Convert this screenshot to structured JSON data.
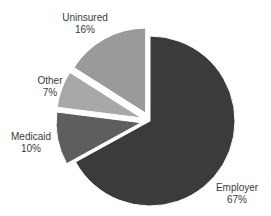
{
  "chart_data": {
    "type": "pie",
    "title": "",
    "categories": [
      "Employer",
      "Medicaid",
      "Other",
      "Uninsured"
    ],
    "values": [
      67,
      10,
      7,
      16
    ],
    "unit": "%",
    "colors": [
      "#3b3b3b",
      "#5e5e5e",
      "#a8a8a8",
      "#9a9a9a"
    ],
    "exploded": [
      "Medicaid",
      "Other",
      "Uninsured"
    ],
    "labels": [
      {
        "name": "Employer",
        "pct": "67%"
      },
      {
        "name": "Medicaid",
        "pct": "10%"
      },
      {
        "name": "Other",
        "pct": "7%"
      },
      {
        "name": "Uninsured",
        "pct": "16%"
      }
    ]
  }
}
